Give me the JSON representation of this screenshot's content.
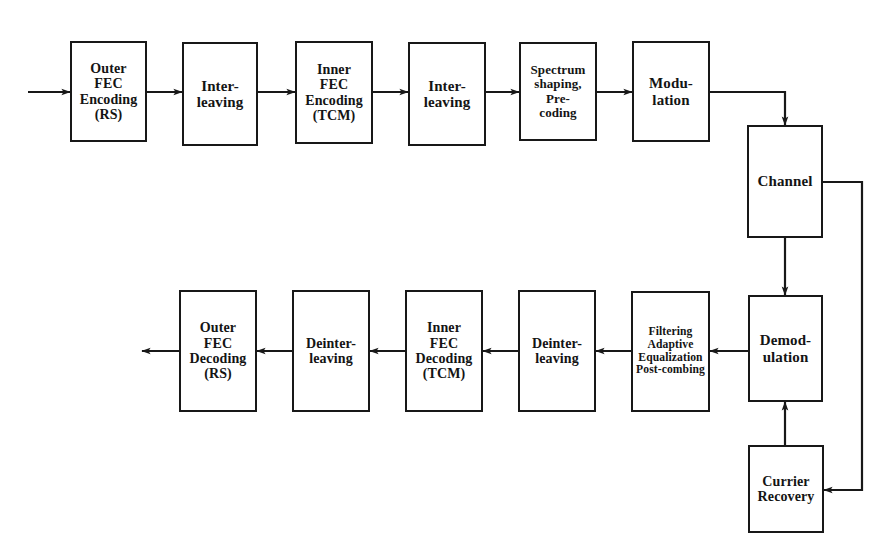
{
  "diagram": {
    "stroke_color": "#181818",
    "background_color": "#ffffff",
    "transmit_chain": [
      {
        "id": "outer-fec-encoding",
        "label": "Outer\nFEC\nEncoding\n(RS)",
        "x": 70,
        "y": 41,
        "w": 77,
        "h": 101,
        "size": "s14"
      },
      {
        "id": "interleaving-1",
        "label": "Inter-\nleaving",
        "x": 182,
        "y": 42,
        "w": 76,
        "h": 104,
        "size": "s15"
      },
      {
        "id": "inner-fec-encoding",
        "label": "Inner\nFEC\nEncoding\n(TCM)",
        "x": 295,
        "y": 41,
        "w": 78,
        "h": 103,
        "size": "s14"
      },
      {
        "id": "interleaving-2",
        "label": "Inter-\nleaving",
        "x": 408,
        "y": 42,
        "w": 78,
        "h": 104,
        "size": "s15"
      },
      {
        "id": "spectrum-shaping-precoding",
        "label": "Spectrum\nshaping,\nPre-\ncoding",
        "x": 519,
        "y": 42,
        "w": 78,
        "h": 99,
        "size": "s13"
      },
      {
        "id": "modulation",
        "label": "Modu-\nlation",
        "x": 632,
        "y": 41,
        "w": 78,
        "h": 101,
        "size": "s15"
      }
    ],
    "channel_chain": [
      {
        "id": "channel",
        "label": "Channel",
        "x": 747,
        "y": 125,
        "w": 76,
        "h": 113,
        "size": "s15"
      },
      {
        "id": "demodulation",
        "label": "Demod-\nulation",
        "x": 748,
        "y": 295,
        "w": 75,
        "h": 107,
        "size": "s15"
      },
      {
        "id": "currier-recovery",
        "label": "Currier\nRecovery",
        "x": 748,
        "y": 445,
        "w": 76,
        "h": 88,
        "size": "s14"
      }
    ],
    "receive_chain": [
      {
        "id": "filtering-equalization",
        "label": "Filtering\nAdaptive\nEqualization\nPost-combing",
        "x": 631,
        "y": 291,
        "w": 79,
        "h": 121,
        "size": "s11"
      },
      {
        "id": "deinterleaving-1",
        "label": "Deinter-\nleaving",
        "x": 518,
        "y": 290,
        "w": 78,
        "h": 122,
        "size": "s14"
      },
      {
        "id": "inner-fec-decoding",
        "label": "Inner\nFEC\nDecoding\n(TCM)",
        "x": 405,
        "y": 290,
        "w": 78,
        "h": 122,
        "size": "s14"
      },
      {
        "id": "deinterleaving-2",
        "label": "Deinter-\nleaving",
        "x": 292,
        "y": 290,
        "w": 78,
        "h": 122,
        "size": "s14"
      },
      {
        "id": "outer-fec-decoding",
        "label": "Outer\nFEC\nDecoding\n(RS)",
        "x": 179,
        "y": 290,
        "w": 78,
        "h": 122,
        "size": "s14"
      }
    ],
    "connectors": [
      {
        "id": "input-arrow",
        "kind": "arrow-right",
        "points": "28,92 70,92"
      },
      {
        "id": "outer-encoding-to-interleaving-1",
        "kind": "arrow-right",
        "points": "147,92 182,92"
      },
      {
        "id": "interleaving-1-to-inner-encoding",
        "kind": "arrow-right",
        "points": "258,92 295,92"
      },
      {
        "id": "inner-encoding-to-interleaving-2",
        "kind": "arrow-right",
        "points": "373,92 408,92"
      },
      {
        "id": "interleaving-2-to-spectrum",
        "kind": "arrow-right",
        "points": "486,92 519,92"
      },
      {
        "id": "spectrum-to-modulation",
        "kind": "arrow-right",
        "points": "597,92 632,92"
      },
      {
        "id": "modulation-to-channel",
        "kind": "arrow-down",
        "points": "710,92 785,92 785,125"
      },
      {
        "id": "channel-to-demodulation",
        "kind": "arrow-down",
        "points": "785,238 785,295"
      },
      {
        "id": "channel-to-currier-recovery",
        "kind": "arrow-left",
        "points": "823,182 862,182 862,490 824,490"
      },
      {
        "id": "currier-recovery-to-demodulation",
        "kind": "arrow-up",
        "points": "785,445 785,402"
      },
      {
        "id": "demodulation-to-filtering",
        "kind": "arrow-left",
        "points": "748,351 710,351"
      },
      {
        "id": "filtering-to-deinterleaving-1",
        "kind": "arrow-left",
        "points": "631,351 596,351"
      },
      {
        "id": "deinterleaving-1-to-inner-decoding",
        "kind": "arrow-left",
        "points": "518,351 483,351"
      },
      {
        "id": "inner-decoding-to-deinterleaving-2",
        "kind": "arrow-left",
        "points": "405,351 370,351"
      },
      {
        "id": "deinterleaving-2-to-outer-decoding",
        "kind": "arrow-left",
        "points": "292,351 257,351"
      },
      {
        "id": "output-arrow",
        "kind": "arrow-left",
        "points": "179,351 142,351"
      }
    ]
  }
}
